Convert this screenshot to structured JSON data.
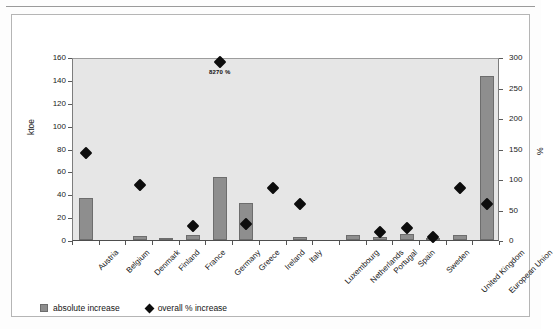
{
  "figure": {
    "left_axis_title": "ktoe",
    "right_axis_title": "%",
    "legend": [
      {
        "label": "absolute increase",
        "marker": "bar-swatch",
        "color": "#8e8e8e"
      },
      {
        "label": "overall % increase",
        "marker": "diamond-swatch",
        "color": "#0d0d0d"
      }
    ]
  },
  "chart_data": {
    "type": "bar",
    "title": "",
    "xlabel": "",
    "ylabel": "ktoe",
    "y2label": "%",
    "ylim": [
      0,
      160
    ],
    "y2lim": [
      0,
      300
    ],
    "yticks": [
      0,
      20,
      40,
      60,
      80,
      100,
      120,
      140,
      160
    ],
    "y2ticks": [
      0,
      50,
      100,
      150,
      200,
      250,
      300
    ],
    "grid": false,
    "legend_position": "bottom-left",
    "categories": [
      "Austria",
      "Belgium",
      "Denmark",
      "Finland",
      "France",
      "Germany",
      "Greece",
      "Ireland",
      "Italy",
      "Luxembourg",
      "Netherlands",
      "Portugal",
      "Spain",
      "Sweden",
      "United Kingdom",
      "European Union"
    ],
    "series": [
      {
        "name": "absolute increase",
        "axis": "left",
        "unit": "ktoe",
        "type": "bar",
        "color": "#8e8e8e",
        "values": [
          37,
          0,
          3.5,
          0.5,
          4,
          55,
          32,
          0,
          3,
          0,
          4,
          3,
          5,
          0.5,
          4,
          143
        ]
      },
      {
        "name": "overall % increase",
        "axis": "right",
        "unit": "%",
        "type": "scatter",
        "color": "#0d0d0d",
        "values": [
          150,
          null,
          97,
          null,
          30,
          300,
          33,
          92,
          67,
          null,
          null,
          20,
          27,
          12,
          92,
          67
        ]
      }
    ],
    "annotations": [
      {
        "text": "8270 %",
        "category": "Germany",
        "series": "overall % increase"
      }
    ]
  }
}
